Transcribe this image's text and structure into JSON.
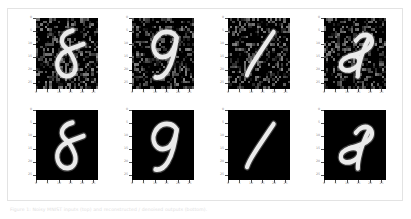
{
  "figure": {
    "caption": "Figure 1: Noisy MNIST inputs (top) and reconstructed / denoised outputs (bottom).",
    "border_color": "#e3e3e3",
    "background_color": "#ffffff"
  },
  "axis": {
    "tick_values": [
      0,
      5,
      10,
      15,
      20,
      25
    ],
    "tick_labels": [
      "0",
      "5",
      "10",
      "15",
      "20",
      "25"
    ],
    "xlim": [
      0,
      27
    ],
    "ylim": [
      0,
      27
    ],
    "tick_color": "#4a4a4a",
    "ticklabel_color": "#8a8a8a"
  },
  "chart_data": {
    "type": "heatmap",
    "title": "",
    "xlabel": "",
    "ylabel": "",
    "grid": false,
    "legend": "none",
    "colormap": "gray",
    "value_range": [
      0,
      255
    ],
    "image_size": [
      28,
      28
    ],
    "layout": {
      "rows": 2,
      "cols": 4
    },
    "row_labels": [
      "noisy",
      "clean"
    ],
    "panels": [
      {
        "index": 0,
        "row": "noisy",
        "col": 0,
        "digit": "8",
        "noise": true,
        "xlim": [
          0,
          27
        ],
        "ylim": [
          0,
          27
        ]
      },
      {
        "index": 1,
        "row": "noisy",
        "col": 1,
        "digit": "9",
        "noise": true,
        "xlim": [
          0,
          27
        ],
        "ylim": [
          0,
          27
        ]
      },
      {
        "index": 2,
        "row": "noisy",
        "col": 2,
        "digit": "1",
        "noise": true,
        "xlim": [
          0,
          27
        ],
        "ylim": [
          0,
          27
        ]
      },
      {
        "index": 3,
        "row": "noisy",
        "col": 3,
        "digit": "2",
        "noise": true,
        "xlim": [
          0,
          27
        ],
        "ylim": [
          0,
          27
        ]
      },
      {
        "index": 4,
        "row": "clean",
        "col": 0,
        "digit": "8",
        "noise": false,
        "xlim": [
          0,
          27
        ],
        "ylim": [
          0,
          27
        ]
      },
      {
        "index": 5,
        "row": "clean",
        "col": 1,
        "digit": "9",
        "noise": false,
        "xlim": [
          0,
          27
        ],
        "ylim": [
          0,
          27
        ]
      },
      {
        "index": 6,
        "row": "clean",
        "col": 2,
        "digit": "1",
        "noise": false,
        "xlim": [
          0,
          27
        ],
        "ylim": [
          0,
          27
        ]
      },
      {
        "index": 7,
        "row": "clean",
        "col": 3,
        "digit": "2",
        "noise": false,
        "xlim": [
          0,
          27
        ],
        "ylim": [
          0,
          27
        ]
      }
    ]
  }
}
